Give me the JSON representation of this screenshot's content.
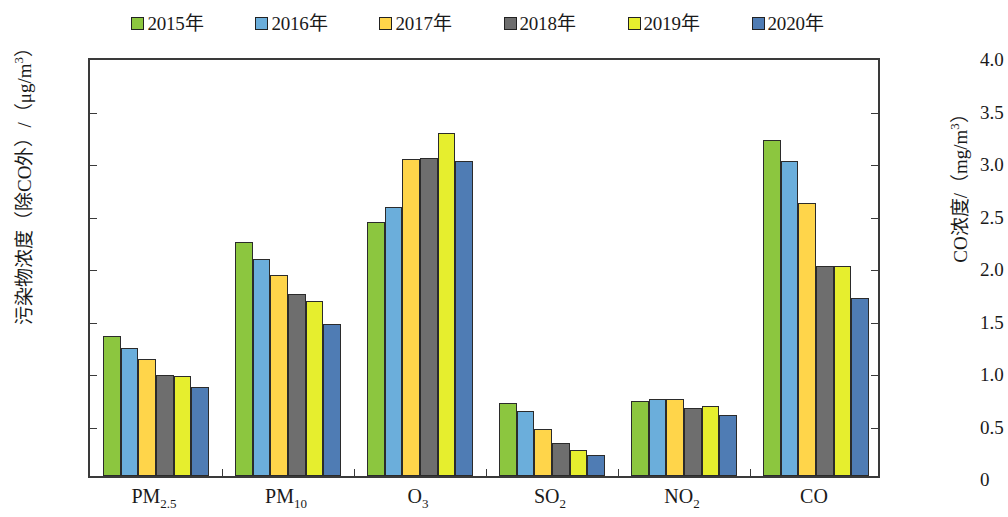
{
  "legend": {
    "items": [
      {
        "label": "2015年",
        "color": "#8CC63F"
      },
      {
        "label": "2016年",
        "color": "#6BAEDB"
      },
      {
        "label": "2017年",
        "color": "#FFD54A"
      },
      {
        "label": "2018年",
        "color": "#6E6E6E"
      },
      {
        "label": "2019年",
        "color": "#E6EE2E"
      },
      {
        "label": "2020年",
        "color": "#4F7CB4"
      }
    ]
  },
  "axes": {
    "left_title_main": "污染物浓度（除CO外）/（μg/m",
    "left_title_sup": "3",
    "left_title_tail": "）",
    "right_title_main": "CO浓度/（mg/m",
    "right_title_sup": "3",
    "right_title_tail": "）",
    "left_ticks": [
      "240",
      "210",
      "180",
      "150",
      "120",
      "90",
      "60",
      "30",
      "0"
    ],
    "right_ticks": [
      "4.0",
      "3.5",
      "3.0",
      "2.5",
      "2.0",
      "1.5",
      "1.0",
      "0.5",
      "0"
    ],
    "left_min": 0,
    "left_max": 240,
    "right_min": 0,
    "right_max": 4.0
  },
  "chart_data": {
    "type": "bar",
    "title": "",
    "xlabel": "",
    "ylabel": "污染物浓度（除CO外）/（μg/m3）",
    "ylabel_secondary": "CO浓度/（mg/m3）",
    "ylim": [
      0,
      240
    ],
    "ylim_secondary": [
      0,
      4.0
    ],
    "grid": false,
    "legend_position": "top",
    "categories": [
      {
        "base": "PM",
        "sub": "2.5",
        "axis": "left"
      },
      {
        "base": "PM",
        "sub": "10",
        "axis": "left"
      },
      {
        "base": "O",
        "sub": "3",
        "axis": "left"
      },
      {
        "base": "SO",
        "sub": "2",
        "axis": "left"
      },
      {
        "base": "NO",
        "sub": "2",
        "axis": "left"
      },
      {
        "base": "CO",
        "sub": "",
        "axis": "right"
      }
    ],
    "category_labels": [
      "PM2.5",
      "PM10",
      "O3",
      "SO2",
      "NO2",
      "CO"
    ],
    "series": [
      {
        "name": "2015年",
        "values": [
          80,
          134,
          145,
          42,
          43,
          3.2
        ]
      },
      {
        "name": "2016年",
        "values": [
          73,
          124,
          154,
          37,
          44,
          3.0
        ]
      },
      {
        "name": "2017年",
        "values": [
          67,
          115,
          181,
          27,
          44,
          2.6
        ]
      },
      {
        "name": "2018年",
        "values": [
          58,
          104,
          182,
          19,
          39,
          2.0
        ]
      },
      {
        "name": "2019年",
        "values": [
          57,
          100,
          196,
          15,
          40,
          2.0
        ]
      },
      {
        "name": "2020年",
        "values": [
          51,
          87,
          180,
          12,
          35,
          1.7
        ]
      }
    ],
    "units": {
      "PM2.5": "μg/m3",
      "PM10": "μg/m3",
      "O3": "μg/m3",
      "SO2": "μg/m3",
      "NO2": "μg/m3",
      "CO": "mg/m3"
    }
  }
}
